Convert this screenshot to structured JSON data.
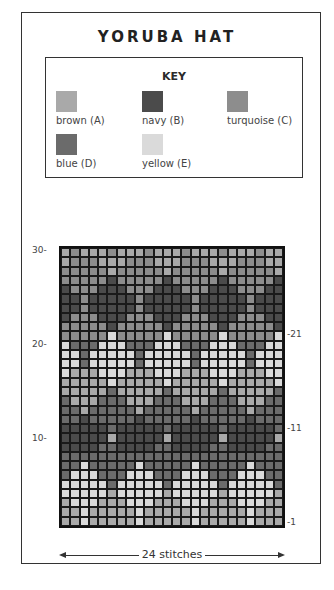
{
  "title": "YORUBA HAT",
  "key": {
    "title": "KEY",
    "items": [
      {
        "code": "A",
        "label": "brown (A)",
        "color": "#a9a9a9"
      },
      {
        "code": "B",
        "label": "navy (B)",
        "color": "#4b4b4b"
      },
      {
        "code": "C",
        "label": "turquoise (C)",
        "color": "#8d8d8d"
      },
      {
        "code": "D",
        "label": "blue (D)",
        "color": "#6b6b6b"
      },
      {
        "code": "E",
        "label": "yellow (E)",
        "color": "#dadada"
      }
    ]
  },
  "chart": {
    "columns": 24,
    "rows_count": 30,
    "left_labels": [
      {
        "row": 30,
        "text": "30-"
      },
      {
        "row": 20,
        "text": "20-"
      },
      {
        "row": 10,
        "text": "10-"
      }
    ],
    "right_labels": [
      {
        "row": 21,
        "text": "-21"
      },
      {
        "row": 11,
        "text": "-11"
      },
      {
        "row": 1,
        "text": "-1"
      }
    ],
    "rows": [
      "ACAAACAAACAAACAAACAAACAA",
      "ACCCAAACCCAAACCCAAACCCAA",
      "CCCCCACCCCCACCCCCACCCCCA",
      "CCCCCBCCCCCBCCCCCBCCCCCB",
      "BCCCBBBCCCBBBCCCBBBCCCBB",
      "BBCBBBBBCBBBBBCBBBBBCBBB",
      "BBCBBBBBCBBBBBCBBBBBCBBB",
      "BCCCBBBCCCBBBCCCBBBCCCBB",
      "CCCCCBCCCCCBCCCCCBCCCCCB",
      "CCCCCECCCCCECCCCCECCCCCE",
      "EDDDEEEDDDEEEDDDEEEDDDEE",
      "EEDEEEEEDEEEEEDEEEEEDEEE",
      "EEDEEEEEDEEEEEDEEEEEDEEE",
      "EAAAEEEAAAEEEAAAEEEAAAEE",
      "AAAAAEAAAAAEAAAAAEAAAAAE",
      "AAAAADAAAAADAAAAADAAAAAD",
      "DAAADDDAAADDDAAADDDAAADD",
      "DDADDDDDADDDDDADDDDDADDD",
      "DDBDDDDDBDDDDDBDDDDDBDDD",
      "BBBBBDBBBBBDBBBBBDBBBBBD",
      "BBBBBABBBBBABBBBBABBBBBA",
      "BBBBDDBBBBDDBBBBDDBBBBDD",
      "DDDDDDDDDDDDDDDDDDDDDDDD",
      "DDEDDDDDEDDDDDEDDDDDEDDD",
      "DEEEDDDEEEDDDEEEDDDEEEDD",
      "EEEEEDEEEEEDEEEEEDEEEEED",
      "EEEEEAEEEEEAEEEEEAEEEEEA",
      "AEEEAAAEEEAAAEEEAAAEEEAA",
      "AAEAAAAAEAAAAAEAAAAAEAAA",
      "AAEAAAAAEAAAAAEAAAAAEAAA"
    ]
  },
  "footer": {
    "label": "24 stitches"
  }
}
